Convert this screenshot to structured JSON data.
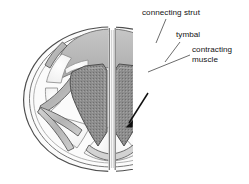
{
  "figure": {
    "type": "anatomical-diagram",
    "view": "mirrored pair of tymbal halves separated by a vertical gap",
    "background_color": "#ffffff"
  },
  "labels": {
    "connecting_strut": "connecting strut",
    "tymbal": "tymbal",
    "contracting_muscle": "contracting muscle"
  },
  "annotations": {
    "arrow": {
      "name": "muscle-contraction-arrow",
      "direction": "down-left",
      "color": "#101010"
    }
  },
  "colors": {
    "outline": "#4a4a4a",
    "tymbal_fill": "#b9b9b9",
    "muscle_fill": "#8d8d8d",
    "rib_fill": "#bdbdbd",
    "panel_fill": "#f4f4f4",
    "leader_line": "#3c3c3c",
    "label_text": "#121212"
  }
}
